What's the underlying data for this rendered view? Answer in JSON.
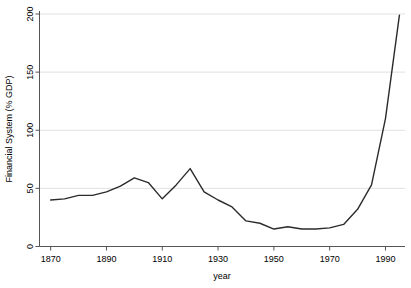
{
  "chart_data": {
    "type": "line",
    "title": "",
    "subtitle": "",
    "xlabel": "year",
    "ylabel": "Financial System (% GDP)",
    "xlim": [
      1866,
      1997
    ],
    "ylim": [
      0,
      200
    ],
    "xticks": [
      1870,
      1890,
      1910,
      1930,
      1950,
      1970,
      1990
    ],
    "xtick_labels": [
      "1870",
      "1890",
      "1910",
      "1930",
      "1950",
      "1970",
      "1990"
    ],
    "yticks": [
      0,
      50,
      100,
      150,
      200
    ],
    "ytick_labels": [
      "0",
      "50",
      "100",
      "150",
      "200"
    ],
    "grid": "horizontal",
    "legend": "none",
    "line_color": "#2b2b2b",
    "grid_color": "#d9d9d9",
    "axis_color": "#555555",
    "series": [
      {
        "name": "Financial System (% GDP)",
        "x": [
          1870,
          1875,
          1880,
          1885,
          1890,
          1895,
          1900,
          1905,
          1910,
          1915,
          1920,
          1925,
          1930,
          1935,
          1940,
          1945,
          1950,
          1955,
          1960,
          1965,
          1970,
          1975,
          1980,
          1985,
          1990,
          1995
        ],
        "values": [
          40,
          41,
          44,
          44,
          47,
          52,
          59,
          55,
          41,
          53,
          67,
          47,
          40,
          34,
          22,
          20,
          15,
          17,
          15,
          15,
          16,
          19,
          32,
          53,
          110,
          199
        ]
      }
    ]
  }
}
